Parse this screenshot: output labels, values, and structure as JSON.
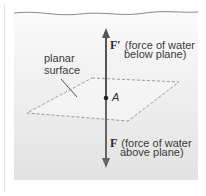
{
  "diagram": {
    "water_region": {
      "fill_top": "#fafafa",
      "fill_bottom": "#e3e3e3",
      "surface_line_color": "#8a8a8a"
    },
    "plane": {
      "label_line1": "planar",
      "label_line2": "surface",
      "edge_style": "dashed",
      "edge_color": "#9a9a9a"
    },
    "point": {
      "label": "A"
    },
    "arrows": {
      "up": {
        "symbol": "F′",
        "desc_line1": "(force of water",
        "desc_line2": "below plane)"
      },
      "down": {
        "symbol": "F",
        "desc_line1": "(force of water",
        "desc_line2": "above plane)"
      },
      "color": "#555555"
    }
  }
}
